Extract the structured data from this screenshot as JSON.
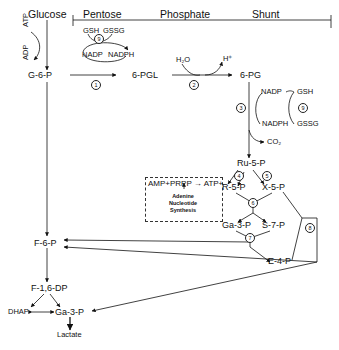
{
  "header": {
    "glucose": "Glucose",
    "shunt_title_parts": [
      "Pentose",
      "Phosphate",
      "Shunt"
    ]
  },
  "cofactors": {
    "atp": "ATP",
    "adp": "ADP",
    "gsh_top": "GSH",
    "gssg_top": "GSSG",
    "nadp_top": "NADP",
    "nadph_top": "NADPH",
    "h2o": "H₂O",
    "h_plus": "H⁺",
    "nadp_right": "NADP",
    "nadph_right": "NADPH",
    "gsh_right": "GSH",
    "gssg_right": "GSSG",
    "co2": "CO₂"
  },
  "metabolites": {
    "g6p": "G-6-P",
    "pgl6": "6-PGL",
    "pg6": "6-PG",
    "ru5p": "Ru-5-P",
    "r5p": "R-5-P",
    "x5p": "X-5-P",
    "ga3p_shunt": "Ga-3-P",
    "s7p": "S-7-P",
    "e4p": "E-4-P",
    "f6p": "F-6-P",
    "f16dp": "F-1,6-DP",
    "dhap": "DHAP",
    "ga3p_glyc": "Ga-3-P",
    "lactate": "Lactate"
  },
  "steps": [
    "1",
    "2",
    "3",
    "4",
    "5",
    "6",
    "7",
    "8",
    "9",
    "9"
  ],
  "adenine_box": {
    "equation": "AMP+PRPP → ATP+",
    "line1": "Adenine",
    "line2": "Nucleotide",
    "line3": "Synthesis"
  }
}
